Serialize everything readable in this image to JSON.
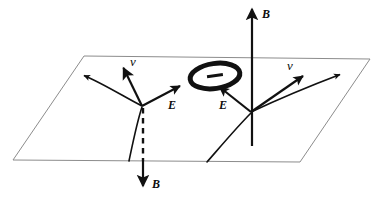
{
  "figure": {
    "type": "physics-vector-diagram",
    "background_color": "#ffffff",
    "plane": {
      "name": "reference-plane",
      "stroke_color": "#8c8c8c",
      "fill": "none",
      "corners": [
        [
          84,
          56
        ],
        [
          370,
          59
        ],
        [
          300,
          162
        ],
        [
          13,
          160
        ]
      ]
    },
    "charge_ring": {
      "sign_label": "−",
      "stroke_color": "#111111",
      "center_x": 215,
      "center_y": 76,
      "rx": 25,
      "ry": 13,
      "rotation_deg": -8,
      "stroke_width": 5
    },
    "labels": {
      "b_up": "B",
      "b_down": "B",
      "e_left": "E",
      "e_right": "E",
      "v_left": "v",
      "v_right": "v"
    },
    "vectors": [
      {
        "name": "magnetic-field-up",
        "symbol": "B",
        "direction": "up",
        "x": 252,
        "from_y": 145,
        "to_y": 8,
        "style": "solid",
        "color": "#111111"
      },
      {
        "name": "magnetic-field-down",
        "symbol": "B",
        "direction": "down",
        "x": 143,
        "from_y": 108,
        "to_y": 188,
        "style": "dashed-above-plane-solid-below",
        "color": "#111111"
      },
      {
        "name": "electric-field-left",
        "symbol": "E",
        "direction": "up-right",
        "from": [
          142,
          106
        ],
        "to": [
          180,
          86
        ],
        "color": "#111111"
      },
      {
        "name": "electric-field-right",
        "symbol": "E",
        "direction": "up-left",
        "from": [
          251,
          112
        ],
        "to": [
          218,
          86
        ],
        "color": "#111111"
      },
      {
        "name": "velocity-left",
        "symbol": "v",
        "direction": "up",
        "from": [
          142,
          106
        ],
        "to": [
          124,
          67
        ],
        "color": "#111111"
      },
      {
        "name": "velocity-right",
        "symbol": "v",
        "direction": "up-right",
        "from": [
          251,
          112
        ],
        "to": [
          305,
          75
        ],
        "color": "#111111"
      },
      {
        "name": "trajectory-left",
        "symbol": "",
        "direction": "up-left",
        "from": [
          142,
          106
        ],
        "to": [
          82,
          75
        ],
        "color": "#111111"
      },
      {
        "name": "trajectory-right",
        "symbol": "",
        "direction": "up-right",
        "from": [
          251,
          112
        ],
        "to": [
          342,
          73
        ],
        "color": "#111111"
      }
    ],
    "curves": [
      {
        "name": "particle-path-left",
        "from": [
          131,
          160
        ],
        "to": [
          142,
          106
        ],
        "color": "#111111"
      },
      {
        "name": "particle-path-right",
        "from": [
          208,
          162
        ],
        "to": [
          251,
          112
        ],
        "color": "#111111"
      }
    ],
    "label_positions": {
      "b_up": {
        "x": 262,
        "y": 8
      },
      "b_down": {
        "x": 152,
        "y": 178
      },
      "e_left": {
        "x": 168,
        "y": 99
      },
      "e_right": {
        "x": 219,
        "y": 99
      },
      "v_left": {
        "x": 130,
        "y": 55
      },
      "v_right": {
        "x": 287,
        "y": 59
      }
    }
  }
}
